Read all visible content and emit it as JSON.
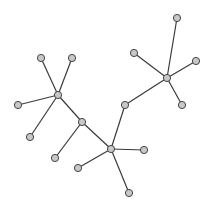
{
  "graph": {
    "type": "tree",
    "node_radius": 3.6,
    "node_fill": "#c8c8c8",
    "node_stroke": "#444444",
    "edge_color": "#3a3a3a",
    "background": "#ffffff",
    "nodes": [
      {
        "id": "A",
        "x": 41,
        "y": 58
      },
      {
        "id": "B",
        "x": 72,
        "y": 58
      },
      {
        "id": "C",
        "x": 58,
        "y": 95
      },
      {
        "id": "D",
        "x": 18,
        "y": 105
      },
      {
        "id": "E",
        "x": 30,
        "y": 137
      },
      {
        "id": "F",
        "x": 82,
        "y": 122
      },
      {
        "id": "G",
        "x": 55,
        "y": 158
      },
      {
        "id": "H",
        "x": 111,
        "y": 149
      },
      {
        "id": "I",
        "x": 78,
        "y": 168
      },
      {
        "id": "J",
        "x": 144,
        "y": 150
      },
      {
        "id": "K",
        "x": 129,
        "y": 193
      },
      {
        "id": "L",
        "x": 125,
        "y": 105
      },
      {
        "id": "M",
        "x": 167,
        "y": 78
      },
      {
        "id": "N",
        "x": 134,
        "y": 53
      },
      {
        "id": "O",
        "x": 177,
        "y": 18
      },
      {
        "id": "P",
        "x": 196,
        "y": 61
      },
      {
        "id": "Q",
        "x": 182,
        "y": 105
      }
    ],
    "edges": [
      [
        "A",
        "C"
      ],
      [
        "B",
        "C"
      ],
      [
        "D",
        "C"
      ],
      [
        "E",
        "C"
      ],
      [
        "C",
        "F"
      ],
      [
        "F",
        "G"
      ],
      [
        "F",
        "H"
      ],
      [
        "H",
        "I"
      ],
      [
        "H",
        "J"
      ],
      [
        "H",
        "K"
      ],
      [
        "H",
        "L"
      ],
      [
        "L",
        "M"
      ],
      [
        "M",
        "N"
      ],
      [
        "M",
        "O"
      ],
      [
        "M",
        "P"
      ],
      [
        "M",
        "Q"
      ]
    ]
  }
}
